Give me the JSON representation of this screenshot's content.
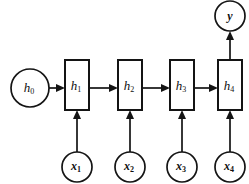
{
  "diagram": {
    "type": "unrolled-recurrent-neural-network",
    "background_color": "#ffffff",
    "stroke_color": "#141414",
    "initial_state": {
      "name": "h0",
      "base": "h",
      "subscript": "0",
      "shape": "circle",
      "cx": 30,
      "cy": 88,
      "r": 19
    },
    "output": {
      "name": "y",
      "base": "y",
      "subscript": "",
      "shape": "circle",
      "cx": 230,
      "cy": 16,
      "r": 15
    },
    "states": [
      {
        "name": "h1",
        "base": "h",
        "subscript": "1",
        "shape": "rect",
        "x": 65,
        "y": 60,
        "w": 24,
        "h": 50
      },
      {
        "name": "h2",
        "base": "h",
        "subscript": "2",
        "shape": "rect",
        "x": 118,
        "y": 60,
        "w": 24,
        "h": 50
      },
      {
        "name": "h3",
        "base": "h",
        "subscript": "3",
        "shape": "rect",
        "x": 170,
        "y": 60,
        "w": 24,
        "h": 50
      },
      {
        "name": "h4",
        "base": "h",
        "subscript": "4",
        "shape": "rect",
        "x": 218,
        "y": 60,
        "w": 24,
        "h": 50
      }
    ],
    "inputs": [
      {
        "name": "x1",
        "base": "x",
        "subscript": "1",
        "shape": "circle",
        "cx": 77,
        "cy": 167,
        "r": 15
      },
      {
        "name": "x2",
        "base": "x",
        "subscript": "2",
        "shape": "circle",
        "cx": 130,
        "cy": 167,
        "r": 15
      },
      {
        "name": "x3",
        "base": "x",
        "subscript": "3",
        "shape": "circle",
        "cx": 182,
        "cy": 167,
        "r": 15
      },
      {
        "name": "x4",
        "base": "x",
        "subscript": "4",
        "shape": "circle",
        "cx": 230,
        "cy": 167,
        "r": 15
      }
    ],
    "edges": [
      {
        "name": "h0-to-h1",
        "from": "h0",
        "to": "h1",
        "direction": "right"
      },
      {
        "name": "h1-to-h2",
        "from": "h1",
        "to": "h2",
        "direction": "right"
      },
      {
        "name": "h2-to-h3",
        "from": "h2",
        "to": "h3",
        "direction": "right"
      },
      {
        "name": "h3-to-h4",
        "from": "h3",
        "to": "h4",
        "direction": "right"
      },
      {
        "name": "x1-to-h1",
        "from": "x1",
        "to": "h1",
        "direction": "up"
      },
      {
        "name": "x2-to-h2",
        "from": "x2",
        "to": "h2",
        "direction": "up"
      },
      {
        "name": "x3-to-h3",
        "from": "x3",
        "to": "h3",
        "direction": "up"
      },
      {
        "name": "x4-to-h4",
        "from": "x4",
        "to": "h4",
        "direction": "up"
      },
      {
        "name": "h4-to-y",
        "from": "h4",
        "to": "y",
        "direction": "up"
      }
    ]
  }
}
